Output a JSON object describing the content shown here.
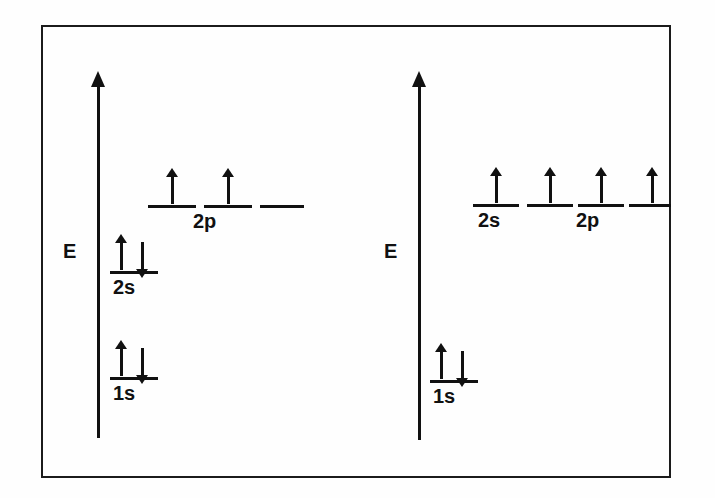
{
  "figure": {
    "background_color": "#fefefe",
    "ink_color": "#111111",
    "frame_color": "#1b1b1b"
  },
  "diagrams": [
    {
      "id": "left-diagram",
      "name": "ground-state-diagram",
      "axis": {
        "label": "E",
        "name": "energy-axis",
        "direction": "up"
      },
      "levels": [
        {
          "name": "level-1s",
          "label": "1s",
          "label_visible": true,
          "electrons": [
            "up",
            "down"
          ],
          "electron_count": 2
        },
        {
          "name": "level-2s",
          "label": "2s",
          "label_visible": true,
          "electrons": [
            "up",
            "down"
          ],
          "electron_count": 2
        },
        {
          "name": "level-2p-x",
          "label": "2p",
          "label_visible": true,
          "electrons": [
            "up"
          ],
          "electron_count": 1
        },
        {
          "name": "level-2p-y",
          "label": "",
          "label_visible": false,
          "electrons": [
            "up"
          ],
          "electron_count": 1
        },
        {
          "name": "level-2p-z",
          "label": "",
          "label_visible": false,
          "electrons": [],
          "electron_count": 0
        }
      ]
    },
    {
      "id": "right-diagram",
      "name": "excited-state-diagram",
      "axis": {
        "label": "E",
        "name": "energy-axis",
        "direction": "up"
      },
      "levels": [
        {
          "name": "level-1s",
          "label": "1s",
          "label_visible": true,
          "electrons": [
            "up",
            "down"
          ],
          "electron_count": 2
        },
        {
          "name": "level-2s",
          "label": "2s",
          "label_visible": true,
          "electrons": [
            "up"
          ],
          "electron_count": 1
        },
        {
          "name": "level-2p-x",
          "label": "2p",
          "label_visible": true,
          "electrons": [
            "up"
          ],
          "electron_count": 1
        },
        {
          "name": "level-2p-y",
          "label": "",
          "label_visible": false,
          "electrons": [
            "up"
          ],
          "electron_count": 1
        },
        {
          "name": "level-2p-z",
          "label": "",
          "label_visible": false,
          "electrons": [
            "up"
          ],
          "electron_count": 1
        }
      ]
    }
  ],
  "labels": {
    "left_axis_E": "E",
    "right_axis_E": "E",
    "left_1s": "1s",
    "left_2s": "2s",
    "left_2p": "2p",
    "right_1s": "1s",
    "right_2s": "2s",
    "right_2p": "2p"
  }
}
